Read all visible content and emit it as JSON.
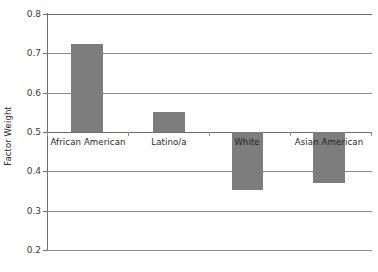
{
  "chart_data": {
    "type": "bar",
    "title": "",
    "xlabel": "",
    "ylabel": "Factor Weight",
    "categories": [
      "African American",
      "Latino/a",
      "White",
      "Asian American"
    ],
    "values": [
      0.72,
      0.55,
      0.35,
      0.37
    ],
    "baseline": 0.5,
    "ylim": [
      0.2,
      0.8
    ],
    "yticks": [
      "0.8",
      "0.7",
      "0.6",
      "0.5",
      "0.4",
      "0.3",
      "0.2"
    ],
    "ytick_values": [
      0.8,
      0.7,
      0.6,
      0.5,
      0.4,
      0.3,
      0.2
    ],
    "grid": true,
    "legend": "none",
    "series": [
      {
        "name": "Factor Weight",
        "values": [
          0.72,
          0.55,
          0.35,
          0.37
        ],
        "color": "#7d7d7d"
      }
    ],
    "colors": {
      "bar": "#7d7d7d",
      "grid": "#8c8c8c",
      "axis": "#6e6e6e",
      "text": "#1f1f1f",
      "background": "#ffffff"
    }
  },
  "axis": {
    "y_title": "Factor Weight"
  },
  "bars": [
    {
      "label": "African American",
      "value": "0.72",
      "left": 24,
      "width": 32,
      "top": 30,
      "height": 88,
      "label_left": 0,
      "label_width": 82
    },
    {
      "label": "Latino/a",
      "value": "0.55",
      "left": 106,
      "width": 32,
      "top": 98,
      "height": 20,
      "label_left": 88,
      "label_width": 68
    },
    {
      "label": "White",
      "value": "0.35",
      "left": 185,
      "width": 31,
      "top": 118,
      "height": 58,
      "label_left": 170,
      "label_width": 60
    },
    {
      "label": "Asian American",
      "value": "0.37",
      "left": 266,
      "width": 32,
      "top": 118,
      "height": 51,
      "label_left": 240,
      "label_width": 84
    }
  ],
  "gridlines": [
    {
      "label": "0.8",
      "top": 0
    },
    {
      "label": "0.7",
      "top": 39
    },
    {
      "label": "0.6",
      "top": 79
    },
    {
      "label": "0.5",
      "top": 118
    },
    {
      "label": "0.4",
      "top": 157
    },
    {
      "label": "0.3",
      "top": 197
    },
    {
      "label": "0.2",
      "top": 236
    }
  ],
  "cat_ticks": [
    0,
    81,
    162,
    243,
    324
  ]
}
